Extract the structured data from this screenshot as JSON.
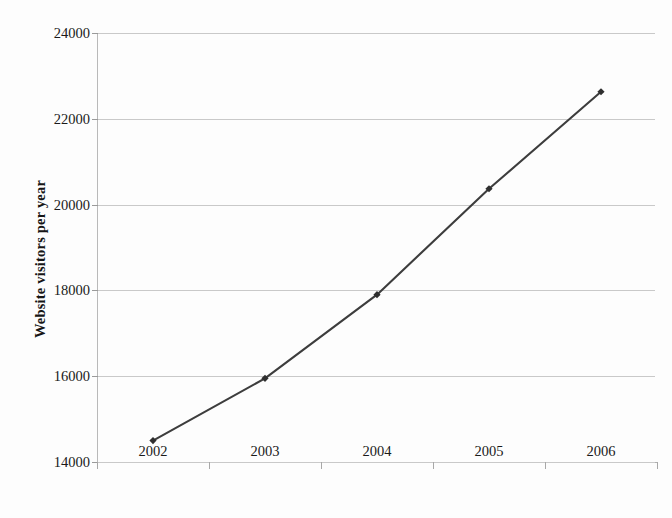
{
  "chart_data": {
    "type": "line",
    "title": "",
    "subtitle": "",
    "xlabel": "",
    "ylabel": "Website visitors per year",
    "categories": [
      "2002",
      "2003",
      "2004",
      "2005",
      "2006"
    ],
    "values": [
      14500,
      15950,
      17900,
      20370,
      22630
    ],
    "series": [
      {
        "name": "Website visitors per year",
        "values": [
          14500,
          15950,
          17900,
          20370,
          22630
        ]
      }
    ],
    "ylim": [
      14000,
      24000
    ],
    "y_ticks": [
      14000,
      16000,
      18000,
      20000,
      22000,
      24000
    ],
    "y_tick_labels": [
      "14000",
      "16000",
      "18000",
      "20000",
      "22000",
      "24000"
    ],
    "x_tick_labels": [
      "2002",
      "2003",
      "2004",
      "2005",
      "2006"
    ],
    "grid": "horizontal",
    "legend": "none",
    "marker": "diamond",
    "line_color": "#3d3d3d",
    "marker_color": "#2f2f2f",
    "gridline_color": "#c9c9c9",
    "axis_color": "#b0b0b0",
    "background_color": "#fdfdfd",
    "annotations": []
  }
}
